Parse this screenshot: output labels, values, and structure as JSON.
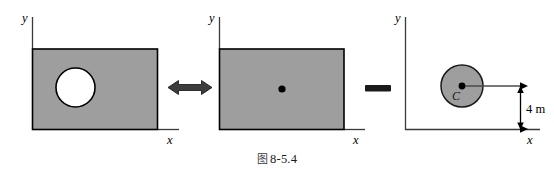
{
  "figure": {
    "caption_marker": "图",
    "caption_number": "8-5.4",
    "caption_full": "图 8-5.4",
    "background_color": "#ffffff",
    "plate_fill": "#9e9e9e",
    "plate_stroke": "#000000",
    "axis_stroke": "#3a3a3a",
    "hole_fill": "#ffffff",
    "disk_fill": "#9e9e9e"
  },
  "panels": [
    {
      "id": "plate-with-hole",
      "role": "composite-body",
      "y_axis_label": "y",
      "x_axis_label": "x",
      "shape": "rectangle-with-circular-hole",
      "hole_label": "",
      "center_marker": false
    },
    {
      "id": "full-plate",
      "role": "whole-body",
      "y_axis_label": "y",
      "x_axis_label": "x",
      "shape": "solid-rectangle",
      "hole_label": "",
      "center_marker": true
    },
    {
      "id": "removed-disk",
      "role": "subtracted-body",
      "y_axis_label": "y",
      "x_axis_label": "x",
      "shape": "solid-circle",
      "hole_label": "C",
      "center_marker": true,
      "dimension": {
        "value": "4",
        "unit": "m",
        "text": "4 m",
        "orientation": "vertical"
      }
    }
  ],
  "operators": [
    {
      "id": "equals-operator",
      "glyph": "double-headed-arrow",
      "meaning": "equivalent-to"
    },
    {
      "id": "minus-operator",
      "glyph": "minus-bar",
      "meaning": "subtract"
    }
  ]
}
